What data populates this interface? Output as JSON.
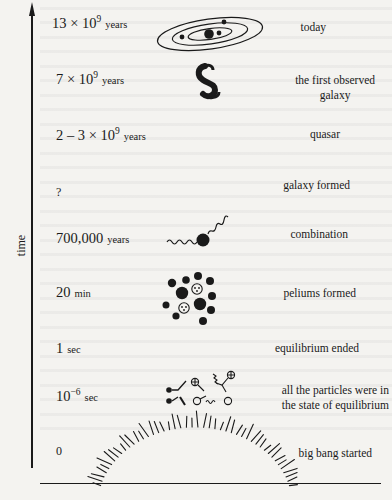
{
  "axis": {
    "y_label": "time"
  },
  "timeline": [
    {
      "time_main": "13 × 10",
      "time_exp": "9",
      "time_unit": "years",
      "event": "today",
      "illustration": "galaxy-orbits-icon"
    },
    {
      "time_main": "7 × 10",
      "time_exp": "9",
      "time_unit": "years",
      "event_line1": "the first observed",
      "event_line2": "galaxy",
      "illustration": "first-galaxy-icon"
    },
    {
      "time_main": "2 – 3 × 10",
      "time_exp": "9",
      "time_unit": "years",
      "event": "quasar"
    },
    {
      "time_main": "?",
      "event": "galaxy  formed"
    },
    {
      "time_main": "700,000",
      "time_unit": "years",
      "event": "combination",
      "illustration": "photon-particle-icon"
    },
    {
      "time_main": "20",
      "time_unit": "min",
      "event": "peliums formed",
      "illustration": "nucleus-cluster-icon"
    },
    {
      "time_main": "1",
      "time_unit": "sec",
      "event": "equilibrium  ended"
    },
    {
      "time_main": "10",
      "time_exp": "−6",
      "time_unit": "sec",
      "event_line1": "all the particles were in",
      "event_line2": "the state of equilibrium",
      "illustration": "particles-equilibrium-icon"
    },
    {
      "time_main": "0",
      "event": "big bang started",
      "illustration": "big-bang-burst-icon"
    }
  ],
  "colors": {
    "ink": "#1a1a1a",
    "paper": "#f4f3f0"
  }
}
